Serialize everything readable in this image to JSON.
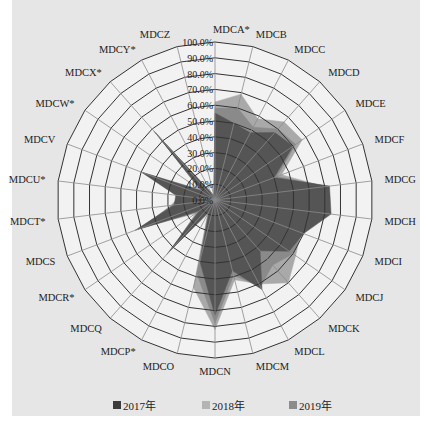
{
  "chart_data": {
    "type": "radar",
    "title": "",
    "center": [
      215,
      200
    ],
    "radius": 158,
    "axis_range": [
      0,
      100
    ],
    "ring_step": 10,
    "ring_labels": [
      "0.0%",
      "10.0%",
      "20.0%",
      "30.0%",
      "40.0%",
      "50.0%",
      "60.0%",
      "70.0%",
      "80.0%",
      "90.0%",
      "100.0%"
    ],
    "categories": [
      "MDCA*",
      "MDCB",
      "MDCC",
      "MDCD",
      "MDCE",
      "MDCF",
      "MDCG",
      "MDCH",
      "MDCI",
      "MDCJ",
      "MDCK",
      "MDCL",
      "MDCM",
      "MDCN",
      "MDCO",
      "MDCP*",
      "MDCQ",
      "MDCR*",
      "MDCS",
      "MDCT*",
      "MDCU*",
      "MDCV",
      "MDCW*",
      "MDCX*",
      "MDCY*",
      "MDCZ"
    ],
    "series": [
      {
        "name": "2018年",
        "color": "#a9a9a9",
        "values": [
          62,
          69,
          58,
          66,
          67,
          45,
          70,
          70,
          58,
          62,
          70,
          60,
          52,
          82,
          57,
          10,
          40,
          15,
          50,
          28,
          22,
          47,
          12,
          55,
          5,
          3
        ]
      },
      {
        "name": "2019年",
        "color": "#8a8a8a",
        "values": [
          58,
          60,
          52,
          60,
          62,
          42,
          71,
          72,
          59,
          60,
          55,
          62,
          49,
          78,
          48,
          9,
          43,
          13,
          52,
          27,
          23,
          49,
          11,
          57,
          5,
          3
        ]
      },
      {
        "name": "2017年",
        "color": "#555555",
        "values": [
          55,
          50,
          48,
          57,
          60,
          40,
          73,
          74,
          60,
          57,
          43,
          64,
          46,
          73,
          40,
          8,
          46,
          12,
          54,
          26,
          25,
          50,
          10,
          58,
          5,
          3
        ]
      }
    ],
    "legend": [
      "2017年",
      "2018年",
      "2019年"
    ],
    "legend_position": "bottom",
    "grid": true
  },
  "legend": {
    "items": [
      {
        "label": "2017年",
        "color": "#3c3c3c"
      },
      {
        "label": "2018年",
        "color": "#b4b4b4"
      },
      {
        "label": "2019年",
        "color": "#8c8c8c"
      }
    ]
  }
}
